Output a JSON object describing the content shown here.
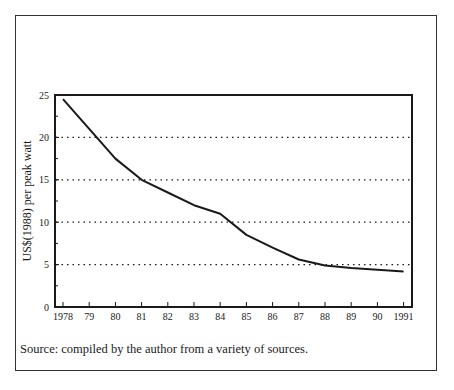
{
  "chart_data": {
    "type": "line",
    "title": "",
    "xlabel": "",
    "ylabel": "US$(1988) per peak watt",
    "x": [
      "1978",
      "79",
      "80",
      "81",
      "82",
      "83",
      "84",
      "85",
      "86",
      "87",
      "88",
      "89",
      "90",
      "1991"
    ],
    "years": [
      1978,
      1979,
      1980,
      1981,
      1982,
      1983,
      1984,
      1985,
      1986,
      1987,
      1988,
      1989,
      1990,
      1991
    ],
    "series": [
      {
        "name": "PV module price",
        "values": [
          24.5,
          21.0,
          17.5,
          15.0,
          13.5,
          12.0,
          11.0,
          8.5,
          7.0,
          5.6,
          4.9,
          4.6,
          4.4,
          4.2
        ]
      }
    ],
    "yticks": [
      "0",
      "5",
      "10",
      "15",
      "20",
      "25"
    ],
    "ylim": [
      0,
      25
    ],
    "grid": "horizontal dotted at 5,10,15,20",
    "legend": "none",
    "source_note": "Source: compiled by the author from a variety of sources."
  },
  "figure": {
    "ylabel": "US$(1988) per peak watt",
    "source": "Source: compiled by the author from a variety of sources."
  }
}
